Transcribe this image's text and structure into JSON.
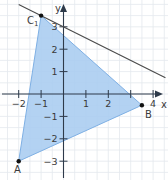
{
  "diagram": {
    "type": "coordinate-plane",
    "axes": {
      "x_label": "x",
      "y_label": "y",
      "x_ticks": [
        {
          "value": -2,
          "label": "−2"
        },
        {
          "value": -1,
          "label": "−1"
        },
        {
          "value": 1,
          "label": "1"
        },
        {
          "value": 2,
          "label": "2"
        },
        {
          "value": 3,
          "label": ""
        },
        {
          "value": 4,
          "label": "4"
        }
      ],
      "y_ticks": [
        {
          "value": 3,
          "label": "3"
        },
        {
          "value": 2,
          "label": "2"
        },
        {
          "value": 1,
          "label": "1"
        },
        {
          "value": -1,
          "label": "−1"
        },
        {
          "value": -2,
          "label": "−2"
        },
        {
          "value": -3,
          "label": "−3"
        }
      ],
      "grid_step": 0.5
    },
    "triangle": {
      "fill": "#a9ccf0",
      "stroke": "#7fb0e4",
      "vertices": [
        {
          "name": "A",
          "x": -2,
          "y": -3
        },
        {
          "name": "B",
          "x": 3.5,
          "y": -0.5
        },
        {
          "name": "C₁",
          "x": -1,
          "y": 3.5
        }
      ]
    },
    "line": {
      "equation": "y = -0.5x + 3",
      "color": "#4a4a4a",
      "through": "C₁"
    },
    "labels": {
      "A": "A",
      "B": "B",
      "C": "C",
      "C_sub": "1"
    },
    "colors": {
      "grid": "#e4e8ee",
      "axis": "#2e3a4a",
      "point": "#111111"
    }
  }
}
